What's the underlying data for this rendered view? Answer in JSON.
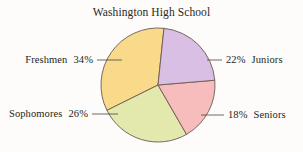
{
  "chart_data": {
    "type": "pie",
    "title": "Washington High School",
    "categories": [
      "Juniors",
      "Seniors",
      "Sophomores",
      "Freshmen"
    ],
    "values": [
      22,
      18,
      26,
      34
    ],
    "value_labels": [
      "22%",
      "18%",
      "26%",
      "34%"
    ],
    "unit": "%",
    "colors": [
      "#d9bfe3",
      "#f7bcbc",
      "#e3e8ad",
      "#f9d98a"
    ],
    "outline_color": "#6b5a52",
    "legend": "none",
    "grid": false,
    "xlabel": "",
    "ylabel": "",
    "start_angle_deg": -84,
    "direction": "clockwise",
    "slices": [
      {
        "name": "Juniors",
        "value": 22,
        "value_label": "22%",
        "color": "#d9bfe3",
        "label_side": "right",
        "label_text": "22%",
        "category_text": "Juniors"
      },
      {
        "name": "Seniors",
        "value": 18,
        "value_label": "18%",
        "color": "#f7bcbc",
        "label_side": "right",
        "label_text": "18%",
        "category_text": "Seniors"
      },
      {
        "name": "Sophomores",
        "value": 26,
        "value_label": "26%",
        "color": "#e3e8ad",
        "label_side": "left",
        "label_text": "26%",
        "category_text": "Sophomores"
      },
      {
        "name": "Freshmen",
        "value": 34,
        "value_label": "34%",
        "color": "#f9d98a",
        "label_side": "left",
        "label_text": "34%",
        "category_text": "Freshmen"
      }
    ]
  }
}
